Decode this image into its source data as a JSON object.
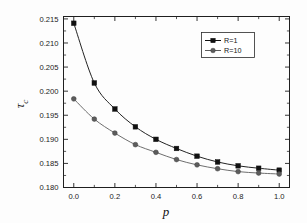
{
  "chart_data": {
    "type": "line",
    "title": "",
    "xlabel": "p",
    "ylabel": "τc",
    "ylabel_base": "τ",
    "ylabel_sub": "c",
    "xlim": [
      -0.05,
      1.05
    ],
    "ylim": [
      0.18,
      0.2155
    ],
    "grid": false,
    "legend_position": "upper right",
    "x": [
      0.0,
      0.1,
      0.2,
      0.3,
      0.4,
      0.5,
      0.6,
      0.7,
      0.8,
      0.9,
      1.0
    ],
    "xticks": [
      "0.0",
      "0.2",
      "0.4",
      "0.6",
      "0.8",
      "1.0"
    ],
    "xtick_values": [
      0.0,
      0.2,
      0.4,
      0.6,
      0.8,
      1.0
    ],
    "xminor_values": [
      0.1,
      0.3,
      0.5,
      0.7,
      0.9
    ],
    "yticks": [
      "0.180",
      "0.185",
      "0.190",
      "0.195",
      "0.200",
      "0.205",
      "0.210",
      "0.215"
    ],
    "ytick_values": [
      0.18,
      0.185,
      0.19,
      0.195,
      0.2,
      0.205,
      0.21,
      0.215
    ],
    "yminor_values": [
      0.1825,
      0.1875,
      0.1925,
      0.1975,
      0.2025,
      0.2075,
      0.2125
    ],
    "series": [
      {
        "name": "R=1",
        "marker": "square",
        "color": "#101010",
        "values": [
          0.2141,
          0.2017,
          0.1963,
          0.1926,
          0.19,
          0.1881,
          0.1865,
          0.1853,
          0.1845,
          0.184,
          0.1836
        ]
      },
      {
        "name": "R=10",
        "marker": "circle",
        "color": "#5c5c5c",
        "values": [
          0.1984,
          0.1942,
          0.1913,
          0.1889,
          0.1873,
          0.1858,
          0.1847,
          0.1839,
          0.1833,
          0.183,
          0.1828
        ]
      }
    ]
  },
  "legend": {
    "entries": [
      {
        "label": "R=1",
        "marker": "square"
      },
      {
        "label": "R=10",
        "marker": "circle"
      }
    ]
  },
  "colors": {
    "series_r1": "#101010",
    "series_r10": "#5c5c5c",
    "axis": "#1f1f1f",
    "background": "#fdfdfd"
  }
}
